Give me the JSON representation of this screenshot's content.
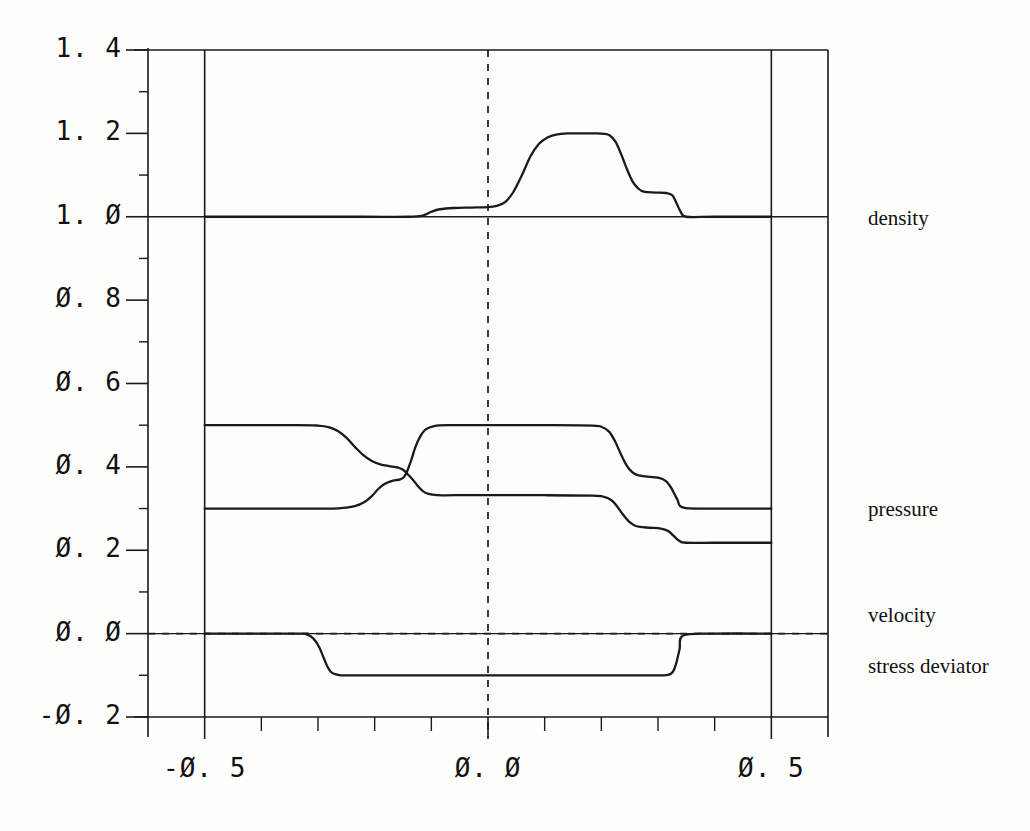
{
  "figure": {
    "background": "#fdfdfc",
    "ink": "#1a1a1a"
  },
  "axes": {
    "x_tick_labels": [
      "-Ø. 5",
      "Ø. Ø",
      "Ø. 5"
    ],
    "x_tick_values": [
      -0.5,
      0.0,
      0.5
    ],
    "y_tick_labels": [
      "1. 4",
      "1. 2",
      "1. Ø",
      "Ø. 8",
      "Ø. 6",
      "Ø. 4",
      "Ø. 2",
      "Ø. Ø",
      "-Ø. 2"
    ],
    "y_tick_values": [
      1.4,
      1.2,
      1.0,
      0.8,
      0.6,
      0.4,
      0.2,
      0.0,
      -0.2
    ]
  },
  "curve_labels": {
    "density": "density",
    "pressure": "pressure",
    "velocity": "velocity",
    "stress_deviator": "stress deviator"
  },
  "chart_data": {
    "type": "line",
    "title": "",
    "xlabel": "",
    "ylabel": "",
    "xlim": [
      -0.6,
      0.6
    ],
    "ylim": [
      -0.2,
      1.4
    ],
    "grid": false,
    "legend_position": "right-outside",
    "reference_lines": [
      {
        "name": "x-zero-dashed",
        "orientation": "vertical",
        "value": 0.0,
        "style": "dashed"
      },
      {
        "name": "y-zero-dashed",
        "orientation": "horizontal",
        "value": 0.0,
        "style": "dashed"
      }
    ],
    "annotations": [
      {
        "text": "density",
        "x": 0.62,
        "y": 1.0
      },
      {
        "text": "pressure",
        "x": 0.62,
        "y": 0.3
      },
      {
        "text": "velocity",
        "x": 0.62,
        "y": 0.04
      },
      {
        "text": "stress deviator",
        "x": 0.62,
        "y": -0.04
      }
    ],
    "series": [
      {
        "name": "density",
        "x": [
          -0.5,
          -0.36,
          -0.22,
          -0.14,
          -0.115,
          -0.1,
          -0.085,
          -0.06,
          -0.03,
          0.0,
          0.015,
          0.03,
          0.045,
          0.06,
          0.075,
          0.09,
          0.105,
          0.12,
          0.14,
          0.165,
          0.19,
          0.205,
          0.215,
          0.225,
          0.235,
          0.245,
          0.255,
          0.265,
          0.275,
          0.295,
          0.315,
          0.325,
          0.332,
          0.34,
          0.35,
          0.4,
          0.5
        ],
        "y": [
          1.0,
          1.0,
          1.0,
          1.0,
          1.003,
          1.012,
          1.018,
          1.021,
          1.022,
          1.023,
          1.026,
          1.035,
          1.06,
          1.1,
          1.145,
          1.175,
          1.19,
          1.197,
          1.2,
          1.2,
          1.2,
          1.199,
          1.195,
          1.18,
          1.15,
          1.115,
          1.085,
          1.068,
          1.06,
          1.058,
          1.057,
          1.052,
          1.035,
          1.012,
          1.0,
          1.0,
          1.0
        ]
      },
      {
        "name": "pressure",
        "x": [
          -0.5,
          -0.34,
          -0.3,
          -0.28,
          -0.265,
          -0.25,
          -0.235,
          -0.22,
          -0.205,
          -0.19,
          -0.175,
          -0.165,
          -0.158,
          -0.15,
          -0.142,
          -0.133,
          -0.125,
          -0.115,
          -0.105,
          -0.09,
          -0.06,
          0.0,
          0.1,
          0.185,
          0.205,
          0.218,
          0.228,
          0.238,
          0.248,
          0.258,
          0.268,
          0.285,
          0.305,
          0.318,
          0.328,
          0.338,
          0.35,
          0.4,
          0.5
        ],
        "y": [
          0.5,
          0.5,
          0.499,
          0.495,
          0.486,
          0.47,
          0.448,
          0.428,
          0.414,
          0.406,
          0.402,
          0.4,
          0.398,
          0.393,
          0.383,
          0.37,
          0.356,
          0.342,
          0.335,
          0.332,
          0.332,
          0.332,
          0.332,
          0.331,
          0.328,
          0.32,
          0.305,
          0.286,
          0.27,
          0.26,
          0.256,
          0.254,
          0.252,
          0.246,
          0.234,
          0.222,
          0.218,
          0.218,
          0.218
        ]
      },
      {
        "name": "pressure-2",
        "x": [
          -0.5,
          -0.3,
          -0.26,
          -0.235,
          -0.218,
          -0.205,
          -0.195,
          -0.186,
          -0.178,
          -0.17,
          -0.163,
          -0.155,
          -0.148,
          -0.142,
          -0.135,
          -0.128,
          -0.12,
          -0.11,
          -0.095,
          -0.07,
          0.0,
          0.1,
          0.185,
          0.202,
          0.214,
          0.224,
          0.234,
          0.244,
          0.254,
          0.264,
          0.278,
          0.3,
          0.314,
          0.324,
          0.334,
          0.345,
          0.4,
          0.5
        ],
        "y": [
          0.3,
          0.3,
          0.301,
          0.306,
          0.316,
          0.33,
          0.345,
          0.356,
          0.362,
          0.366,
          0.368,
          0.37,
          0.376,
          0.392,
          0.418,
          0.448,
          0.472,
          0.49,
          0.498,
          0.5,
          0.5,
          0.5,
          0.499,
          0.495,
          0.484,
          0.462,
          0.432,
          0.405,
          0.388,
          0.38,
          0.377,
          0.374,
          0.366,
          0.348,
          0.322,
          0.302,
          0.3,
          0.3
        ]
      },
      {
        "name": "velocity",
        "x": [
          -0.5,
          -0.335,
          -0.32,
          -0.308,
          -0.298,
          -0.29,
          -0.283,
          -0.277,
          -0.27,
          -0.26,
          -0.24,
          -0.2,
          -0.1,
          0.0,
          0.1,
          0.185,
          0.205,
          0.218,
          0.228,
          0.238,
          0.248,
          0.258,
          0.268,
          0.285,
          0.305,
          0.318,
          0.326,
          0.332,
          0.338,
          0.345,
          0.4,
          0.5
        ],
        "y": [
          0.0,
          0.0,
          -0.002,
          -0.012,
          -0.032,
          -0.058,
          -0.08,
          -0.092,
          -0.097,
          -0.1,
          -0.1,
          -0.1,
          -0.1,
          -0.1,
          -0.1,
          -0.1,
          -0.1,
          -0.1,
          -0.1,
          -0.1,
          -0.1,
          -0.1,
          -0.1,
          -0.1,
          -0.1,
          -0.099,
          -0.092,
          -0.072,
          -0.038,
          -0.004,
          0.0,
          0.0
        ]
      }
    ]
  }
}
